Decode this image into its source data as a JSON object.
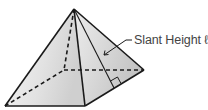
{
  "diagram": {
    "type": "square-pyramid",
    "labels": {
      "slant_height": "Slant Height ℓ"
    },
    "colors": {
      "edge": "#1a1a1a",
      "face_left_light": "#f4f4f4",
      "face_left_dark": "#d2d2d2",
      "face_right_light": "#e6e6e6",
      "face_right_dark": "#c4c4c4",
      "label_text": "#444444"
    }
  }
}
